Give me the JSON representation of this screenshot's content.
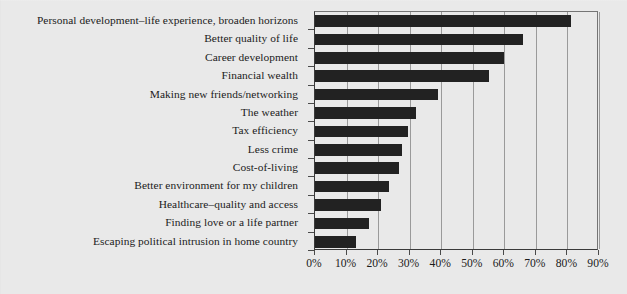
{
  "chart_data": {
    "type": "bar",
    "orientation": "horizontal",
    "title": "",
    "subtitle": "",
    "xlabel": "",
    "ylabel": "",
    "xlim": [
      0,
      90
    ],
    "xtick_labels": [
      "0%",
      "10%",
      "20%",
      "30%",
      "40%",
      "50%",
      "60%",
      "70%",
      "80%",
      "90%"
    ],
    "xticks": [
      0,
      10,
      20,
      30,
      40,
      50,
      60,
      70,
      80,
      90
    ],
    "grid": "vertical",
    "legend": "none",
    "bar_color": "#222222",
    "background_color": "#e9e9e9",
    "categories": [
      "Personal development–life experience, broaden horizons",
      "Better quality of life",
      "Career development",
      "Financial wealth",
      "Making new friends/networking",
      "The weather",
      "Tax efficiency",
      "Less crime",
      "Cost-of-living",
      "Better environment for my children",
      "Healthcare–quality and access",
      "Finding love or a life partner",
      "Escaping political intrusion in home country"
    ],
    "values": [
      81,
      66,
      60,
      55,
      39,
      32,
      29.5,
      27.5,
      26.5,
      23.5,
      21,
      17,
      13
    ]
  }
}
